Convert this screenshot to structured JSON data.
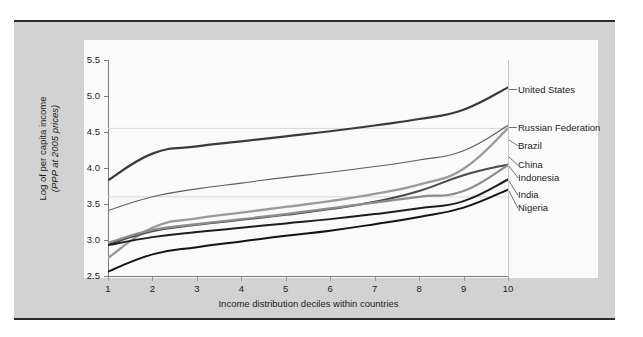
{
  "chart_data": {
    "type": "line",
    "title": "",
    "xlabel": "Income distribution deciles within countries",
    "ylabel": "Log of per capita income",
    "ylabel_units": "(PPP at 2005 prices)",
    "x": [
      1,
      2,
      3,
      4,
      5,
      6,
      7,
      8,
      9,
      10
    ],
    "xticklabels": [
      "1",
      "2",
      "3",
      "4",
      "5",
      "6",
      "7",
      "8",
      "9",
      "10"
    ],
    "yticklabels": [
      "2.5",
      "3.0",
      "3.5",
      "4.0",
      "4.5",
      "5.0",
      "5.5"
    ],
    "yticks": [
      2.5,
      3.0,
      3.5,
      4.0,
      4.5,
      5.0,
      5.5
    ],
    "xlim": [
      1,
      10
    ],
    "ylim": [
      2.5,
      5.5
    ],
    "grid": "horizontal-faint",
    "legend_position": "right-of-plot-inline",
    "series": [
      {
        "name": "United States",
        "color": "#3a3a3a",
        "width": 2.2,
        "values": [
          3.83,
          4.2,
          4.3,
          4.37,
          4.44,
          4.51,
          4.59,
          4.68,
          4.81,
          5.12
        ]
      },
      {
        "name": "Russian Federation",
        "color": "#5e5e5e",
        "width": 1.1,
        "values": [
          3.41,
          3.6,
          3.71,
          3.79,
          3.87,
          3.94,
          4.02,
          4.11,
          4.24,
          4.59
        ]
      },
      {
        "name": "Brazil",
        "color": "#9b9b9b",
        "width": 2.4,
        "values": [
          2.75,
          3.17,
          3.3,
          3.38,
          3.46,
          3.54,
          3.64,
          3.77,
          3.99,
          4.55
        ]
      },
      {
        "name": "China",
        "color": "#4a4a4a",
        "width": 2.0,
        "values": [
          2.94,
          3.12,
          3.21,
          3.28,
          3.35,
          3.43,
          3.53,
          3.68,
          3.9,
          4.05
        ]
      },
      {
        "name": "Indonesia",
        "color": "#8d8d8d",
        "width": 2.2,
        "values": [
          2.96,
          3.14,
          3.22,
          3.29,
          3.36,
          3.44,
          3.52,
          3.6,
          3.68,
          4.04
        ]
      },
      {
        "name": "India",
        "color": "#1e1e1e",
        "width": 2.0,
        "values": [
          2.93,
          3.04,
          3.11,
          3.17,
          3.23,
          3.29,
          3.36,
          3.44,
          3.54,
          3.84
        ]
      },
      {
        "name": "Nigeria",
        "color": "#141414",
        "width": 2.0,
        "values": [
          2.56,
          2.8,
          2.9,
          2.98,
          3.06,
          3.13,
          3.22,
          3.32,
          3.45,
          3.7
        ]
      }
    ],
    "legend_entries": [
      {
        "label": "United States",
        "y_value": 5.12
      },
      {
        "label": "Russian Federation",
        "y_value": 4.59
      },
      {
        "label": "Brazil",
        "y_value": 4.4
      },
      {
        "label": "China",
        "y_value": 4.17
      },
      {
        "label": "Indonesia",
        "y_value": 4.04
      },
      {
        "label": "India",
        "y_value": 3.84
      },
      {
        "label": "Nigeria",
        "y_value": 3.7
      }
    ]
  },
  "colors": {
    "figure_background": "#d2d2d2",
    "canvas_background": "#fafafa",
    "page_background": "#ffffff",
    "axis": "#7a7a7a",
    "text": "#1c1c1c",
    "gridline": "#d8d8d8",
    "frame_rule": "#2b2b2b"
  }
}
